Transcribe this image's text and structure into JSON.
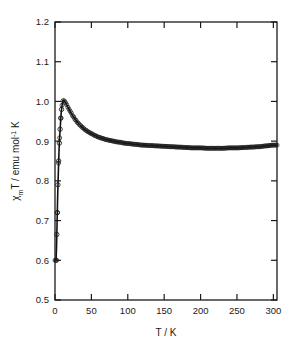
{
  "chart_data": {
    "type": "scatter",
    "title": "",
    "subtitle": "",
    "xlabel": "T / K",
    "ylabel": "χₘT / emu mol⁻¹ K",
    "ylabel_parts": {
      "chi": "χ",
      "sub": "m",
      "rest": "T / emu mol",
      "sup": "-1",
      "tail": " K"
    },
    "xlim": [
      0,
      305
    ],
    "ylim": [
      0.5,
      1.2
    ],
    "xticks": [
      0,
      50,
      100,
      150,
      200,
      250,
      300
    ],
    "xtick_labels": [
      "0",
      "50",
      "100",
      "150",
      "200",
      "250",
      "300"
    ],
    "yticks": [
      0.5,
      0.6,
      0.7,
      0.8,
      0.9,
      1.0,
      1.1,
      1.2
    ],
    "ytick_labels": [
      "0.5",
      "0.6",
      "0.7",
      "0.8",
      "0.9",
      "1.0",
      "1.1",
      "1.2"
    ],
    "grid": false,
    "legend": null,
    "tick_direction": "in",
    "frame": "box",
    "marker": "open-circle",
    "marker_color": "#1a1a1a",
    "line_color": "#111111",
    "series": [
      {
        "name": "chiT data",
        "style": "open circles with solid fit line",
        "x": [
          1.8,
          2.5,
          3.2,
          4.0,
          5.0,
          6.0,
          7.0,
          8.0,
          9.0,
          10.0,
          11.0,
          12.0,
          13.0,
          14.5,
          16.0,
          18.0,
          20.0,
          22.0,
          25.0,
          28.0,
          31.0,
          34.0,
          38.0,
          42.0,
          46.0,
          50.0,
          55.0,
          60.0,
          65.0,
          70.0,
          75.0,
          80.0,
          85.0,
          90.0,
          95.0,
          100.0,
          110.0,
          120.0,
          130.0,
          140.0,
          150.0,
          160.0,
          170.0,
          180.0,
          190.0,
          200.0,
          210.0,
          220.0,
          230.0,
          240.0,
          250.0,
          260.0,
          270.0,
          280.0,
          290.0,
          300.0
        ],
        "y": [
          0.6,
          0.665,
          0.72,
          0.79,
          0.85,
          0.895,
          0.93,
          0.958,
          0.98,
          0.995,
          1.002,
          1.003,
          1.001,
          0.997,
          0.992,
          0.985,
          0.978,
          0.971,
          0.962,
          0.954,
          0.947,
          0.941,
          0.934,
          0.928,
          0.923,
          0.919,
          0.914,
          0.91,
          0.907,
          0.904,
          0.902,
          0.9,
          0.898,
          0.897,
          0.895,
          0.894,
          0.892,
          0.89,
          0.889,
          0.888,
          0.887,
          0.886,
          0.885,
          0.884,
          0.883,
          0.883,
          0.882,
          0.882,
          0.882,
          0.883,
          0.883,
          0.884,
          0.885,
          0.886,
          0.888,
          0.89
        ]
      }
    ],
    "annotations": [
      {
        "text": "sharp maximum near 11 K",
        "value": 1.003
      },
      {
        "text": "broad shallow minimum near 220 K",
        "value": 0.882
      }
    ]
  }
}
